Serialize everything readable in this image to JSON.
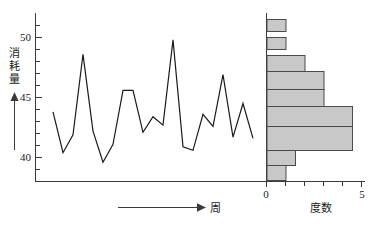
{
  "figure": {
    "background_color": "#ffffff",
    "line_color": "#1a1a1a",
    "bar_fill_color": "#c8c8c8",
    "bar_edge_color": "#4a4a4a",
    "axis_color": "#3a3a3a"
  },
  "chart_data": [
    {
      "type": "line",
      "title": "",
      "xlabel": "周",
      "ylabel": "消耗量",
      "ylim": [
        38,
        51
      ],
      "yticks": [
        40,
        45,
        50
      ],
      "ytick_labels": [
        "40",
        "45",
        "50"
      ],
      "minor_tick_step": 1,
      "grid": false,
      "legend": "none",
      "x": [
        1,
        2,
        3,
        4,
        5,
        6,
        7,
        8,
        9,
        10,
        11,
        12,
        13,
        14,
        15,
        16,
        17,
        18,
        19,
        20,
        21
      ],
      "values": [
        43.8,
        40.4,
        41.9,
        48.6,
        42.2,
        39.6,
        41.1,
        45.6,
        45.6,
        42.1,
        43.4,
        42.7,
        49.8,
        40.9,
        40.6,
        43.6,
        42.6,
        46.9,
        41.7,
        44.5,
        41.6
      ],
      "xaxis_arrow_label": "周",
      "yaxis_arrow": true
    },
    {
      "type": "bar",
      "orientation": "horizontal",
      "title": "",
      "xlabel": "度数",
      "ylabel": "",
      "xlim": [
        0,
        5
      ],
      "xticks": [
        0,
        1,
        2,
        3,
        4,
        5
      ],
      "xtick_labels": [
        "0",
        "",
        "",
        "",
        "",
        "5"
      ],
      "grid": false,
      "legend": "none",
      "bin_centers": [
        49.5,
        48.5,
        47.5,
        46.5,
        45.5,
        44.5,
        43.5,
        42.5,
        41.5,
        40.5
      ],
      "categories": [
        "49-50",
        "48-49",
        "47-48",
        "46-47",
        "45-46",
        "44-45",
        "43-44",
        "42-43",
        "41-42",
        "40-41"
      ],
      "values": [
        1,
        1,
        2,
        3,
        3,
        4.5,
        4.5,
        1.5,
        1,
        0
      ]
    }
  ],
  "axes": {
    "left": {
      "tick_labels": [
        "50",
        "45",
        "40"
      ],
      "title": "消耗量",
      "title_chars": [
        "消",
        "耗",
        "量"
      ]
    },
    "bottom_left": {
      "arrow_label": "周"
    },
    "bottom_right": {
      "tick_label_min": "0",
      "tick_label_max": "5",
      "title": "度数"
    }
  }
}
